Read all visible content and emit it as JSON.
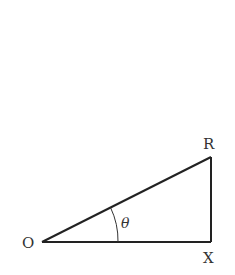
{
  "diagram": {
    "type": "right-triangle",
    "vertices": {
      "O": {
        "label": "O",
        "x": 42,
        "y": 242
      },
      "X": {
        "label": "X",
        "x": 211,
        "y": 242
      },
      "R": {
        "label": "R",
        "x": 211,
        "y": 157
      }
    },
    "angle": {
      "label": "θ",
      "at": "O"
    },
    "stroke_color": "#222222"
  }
}
